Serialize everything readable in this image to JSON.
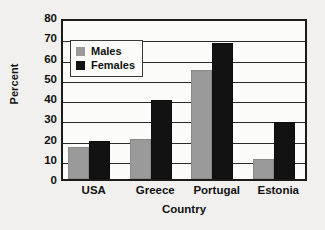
{
  "chart_data": {
    "type": "bar",
    "title": "",
    "subtitle": "",
    "categories": [
      "USA",
      "Greece",
      "Portugal",
      "Estonia"
    ],
    "series": [
      {
        "name": "Males",
        "color": "#9a9a9a",
        "values": [
          16,
          20,
          54,
          10
        ]
      },
      {
        "name": "Females",
        "color": "#121212",
        "values": [
          19,
          39,
          67,
          28
        ]
      }
    ],
    "xlabel": "Country",
    "ylabel": "Percent",
    "ylim": [
      0,
      80
    ],
    "ytick_step": 10,
    "yticks": [
      0,
      10,
      20,
      30,
      40,
      50,
      60,
      70,
      80
    ],
    "ytick_labels": [
      "0",
      "10",
      "20",
      "30",
      "40",
      "50",
      "60",
      "70",
      "80"
    ],
    "grid": "horizontal",
    "legend_position": "upper-left-inside",
    "legend_entries": [
      "Males",
      "Females"
    ],
    "annotations": []
  },
  "axes": {
    "y_title": "Percent",
    "x_title": "Country",
    "y_ticks": [
      {
        "label": "80",
        "value": 80
      },
      {
        "label": "70",
        "value": 70
      },
      {
        "label": "60",
        "value": 60
      },
      {
        "label": "50",
        "value": 50
      },
      {
        "label": "40",
        "value": 40
      },
      {
        "label": "30",
        "value": 30
      },
      {
        "label": "20",
        "value": 20
      },
      {
        "label": "10",
        "value": 10
      },
      {
        "label": "0",
        "value": 0
      }
    ],
    "x_ticks": [
      {
        "label": "USA"
      },
      {
        "label": "Greece"
      },
      {
        "label": "Portugal"
      },
      {
        "label": "Estonia"
      }
    ]
  },
  "legend": {
    "items": [
      {
        "label": "Males",
        "swatch": "males-swatch"
      },
      {
        "label": "Females",
        "swatch": "females-swatch"
      }
    ]
  },
  "colors": {
    "males": "#9a9a9a",
    "females": "#121212",
    "frame": "#1b1b1b",
    "gridline": "#2b2b2b",
    "plot_background": "#fbfbfa",
    "page_background": "#f1f0ee"
  }
}
